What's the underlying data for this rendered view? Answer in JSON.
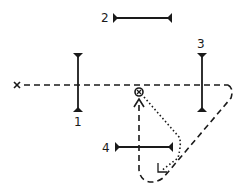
{
  "diagram": {
    "type": "optical-path-schematic",
    "source_marker": "x",
    "mirrors": [
      {
        "label": "1",
        "orientation": "vertical"
      },
      {
        "label": "2",
        "orientation": "horizontal"
      },
      {
        "label": "3",
        "orientation": "vertical"
      },
      {
        "label": "4",
        "orientation": "horizontal"
      }
    ],
    "center_symbol": "circled-x",
    "paths": [
      {
        "style": "dashed",
        "description": "horizontal line from source x through mirror 1 and mirror 3, loops down-left back up to center with arrow"
      },
      {
        "style": "dotted",
        "description": "from center down-right then back down-left with arrowhead"
      }
    ],
    "colors": {
      "ink": "#1a1a1a",
      "background": "#ffffff"
    }
  }
}
